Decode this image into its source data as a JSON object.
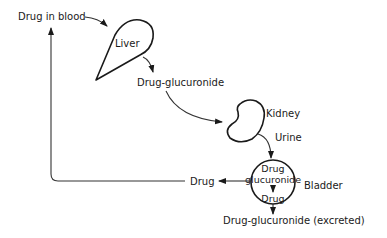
{
  "diagram": {
    "type": "flow",
    "title": "",
    "colors": {
      "ink": "#1a1a1a",
      "background": "#ffffff"
    },
    "nodes": {
      "drug_in_blood": {
        "label": "Drug in blood"
      },
      "liver": {
        "label": "Liver"
      },
      "drug_glucuronide_liver": {
        "label": "Drug-glucuronide"
      },
      "kidney": {
        "label": "Kidney"
      },
      "urine": {
        "label": "Urine"
      },
      "bladder": {
        "label": "Bladder",
        "inner_top_line1": "Drug",
        "inner_top_line2": "glucuronide",
        "inner_bottom": "Drug"
      },
      "drug_reabsorbed": {
        "label": "Drug"
      },
      "excreted": {
        "label": "Drug-glucuronide (excreted)"
      }
    },
    "edges": [
      {
        "from": "Drug in blood",
        "to": "Liver"
      },
      {
        "from": "Liver",
        "to": "Drug-glucuronide"
      },
      {
        "from": "Drug-glucuronide",
        "to": "Kidney"
      },
      {
        "from": "Kidney",
        "to": "Bladder",
        "label": "Urine"
      },
      {
        "from": "Drug glucuronide",
        "to": "Drug",
        "within": "Bladder"
      },
      {
        "from": "Bladder",
        "to": "Drug"
      },
      {
        "from": "Drug",
        "to": "Drug in blood"
      },
      {
        "from": "Bladder",
        "to": "Drug-glucuronide (excreted)"
      }
    ]
  }
}
